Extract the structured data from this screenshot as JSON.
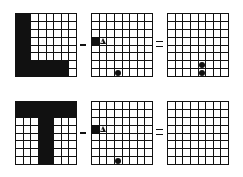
{
  "rows": [
    {
      "name": "L-row",
      "operator1": "minus",
      "operator2": "equals",
      "grids": [
        {
          "name": "L-shape",
          "black_cells": [
            [
              0,
              0
            ],
            [
              0,
              1
            ],
            [
              1,
              0
            ],
            [
              1,
              1
            ],
            [
              2,
              0
            ],
            [
              2,
              1
            ],
            [
              3,
              0
            ],
            [
              3,
              1
            ],
            [
              4,
              0
            ],
            [
              4,
              1
            ],
            [
              5,
              0
            ],
            [
              5,
              1
            ],
            [
              6,
              0
            ],
            [
              6,
              1
            ],
            [
              6,
              2
            ],
            [
              6,
              3
            ],
            [
              6,
              4
            ],
            [
              6,
              5
            ],
            [
              6,
              6
            ],
            [
              7,
              0
            ],
            [
              7,
              1
            ],
            [
              7,
              2
            ],
            [
              7,
              3
            ],
            [
              7,
              4
            ],
            [
              7,
              5
            ],
            [
              7,
              6
            ]
          ],
          "marks": []
        },
        {
          "name": "operand",
          "black_cells": [
            [
              3,
              0
            ]
          ],
          "marks": [
            {
              "r": 3,
              "c": 1,
              "type": "triangle"
            },
            {
              "r": 7,
              "c": 3,
              "type": "dot"
            }
          ]
        },
        {
          "name": "result",
          "black_cells": [],
          "marks": [
            {
              "r": 6,
              "c": 4,
              "type": "dot"
            },
            {
              "r": 7,
              "c": 4,
              "type": "dot"
            }
          ]
        }
      ]
    },
    {
      "name": "T-row",
      "operator1": "minus",
      "operator2": "equals",
      "grids": [
        {
          "name": "T-shape",
          "black_cells": [
            [
              0,
              0
            ],
            [
              0,
              1
            ],
            [
              0,
              2
            ],
            [
              0,
              3
            ],
            [
              0,
              4
            ],
            [
              0,
              5
            ],
            [
              0,
              6
            ],
            [
              0,
              7
            ],
            [
              1,
              0
            ],
            [
              1,
              1
            ],
            [
              1,
              2
            ],
            [
              1,
              3
            ],
            [
              1,
              4
            ],
            [
              1,
              5
            ],
            [
              1,
              6
            ],
            [
              1,
              7
            ],
            [
              2,
              3
            ],
            [
              2,
              4
            ],
            [
              3,
              3
            ],
            [
              3,
              4
            ],
            [
              4,
              3
            ],
            [
              4,
              4
            ],
            [
              5,
              3
            ],
            [
              5,
              4
            ],
            [
              6,
              3
            ],
            [
              6,
              4
            ],
            [
              7,
              3
            ],
            [
              7,
              4
            ]
          ],
          "marks": []
        },
        {
          "name": "operand",
          "black_cells": [
            [
              3,
              0
            ]
          ],
          "marks": [
            {
              "r": 3,
              "c": 1,
              "type": "triangle"
            },
            {
              "r": 7,
              "c": 3,
              "type": "dot"
            }
          ]
        },
        {
          "name": "result",
          "black_cells": [],
          "marks": []
        }
      ]
    }
  ],
  "grid_size": 8
}
